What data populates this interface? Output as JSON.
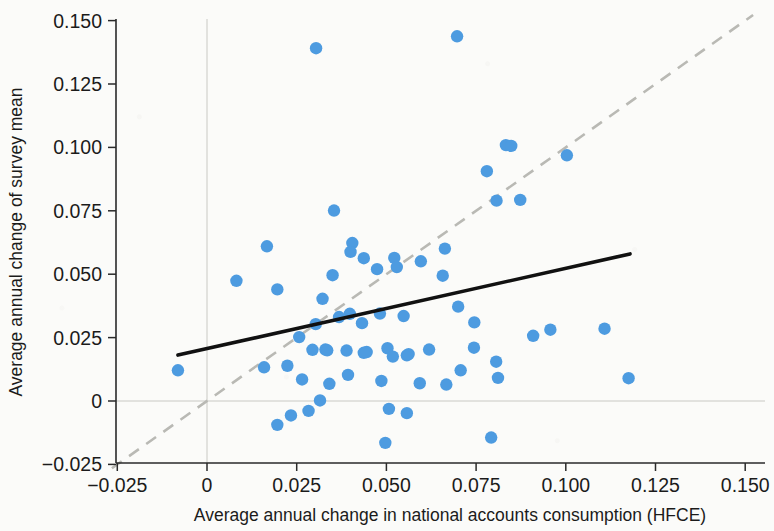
{
  "chart_data": {
    "type": "scatter",
    "title": "",
    "xlabel": "Average annual change in national accounts consumption (HFCE)",
    "ylabel": "Average annual change of survey mean",
    "xlim": [
      -0.0325,
      0.1565
    ],
    "ylim": [
      -0.0295,
      0.153
    ],
    "xticks": [
      -0.025,
      0,
      0.025,
      0.05,
      0.075,
      0.1,
      0.125,
      0.15
    ],
    "xtick_labels": [
      "−0.025",
      "0",
      "0.025",
      "0.050",
      "0.075",
      "0.100",
      "0.125",
      "0.150"
    ],
    "yticks": [
      -0.025,
      0,
      0.025,
      0.05,
      0.075,
      0.1,
      0.125,
      0.15
    ],
    "ytick_labels": [
      "−0.025",
      "0",
      "0.025",
      "0.050",
      "0.075",
      "0.100",
      "0.125",
      "0.150"
    ],
    "grid": "zero-lines-only",
    "legend": "none",
    "point_color": "#4d9be0",
    "point_radius_px": 6.2,
    "fit_line": {
      "name": "linear fit",
      "color": "#111111",
      "style": "solid",
      "x": [
        -0.0081,
        0.1179
      ],
      "y": [
        0.0181,
        0.058
      ]
    },
    "identity_line": {
      "name": "45-degree line",
      "color": "#b9b9b4",
      "style": "dashed",
      "x": [
        -0.0265,
        0.1522
      ],
      "y": [
        -0.0265,
        0.1522
      ]
    },
    "series": [
      {
        "name": "Countries",
        "points": [
          [
            0.0304,
            0.1391
          ],
          [
            0.0697,
            0.1438
          ],
          [
            0.0833,
            0.1009
          ],
          [
            0.0848,
            0.1006
          ],
          [
            0.1003,
            0.0969
          ],
          [
            0.078,
            0.0906
          ],
          [
            0.0807,
            0.079
          ],
          [
            0.0873,
            0.0793
          ],
          [
            0.0354,
            0.0751
          ],
          [
            0.0167,
            0.061
          ],
          [
            0.0405,
            0.0623
          ],
          [
            0.04,
            0.0588
          ],
          [
            0.0437,
            0.0563
          ],
          [
            0.0522,
            0.0564
          ],
          [
            0.0663,
            0.0601
          ],
          [
            0.0596,
            0.0551
          ],
          [
            0.0529,
            0.0528
          ],
          [
            0.0082,
            0.0474
          ],
          [
            0.035,
            0.0496
          ],
          [
            0.0196,
            0.044
          ],
          [
            0.0474,
            0.052
          ],
          [
            0.0657,
            0.0494
          ],
          [
            0.0322,
            0.0403
          ],
          [
            0.07,
            0.0372
          ],
          [
            0.0368,
            0.0331
          ],
          [
            0.0398,
            0.0344
          ],
          [
            0.0482,
            0.0345
          ],
          [
            0.0548,
            0.0335
          ],
          [
            0.0303,
            0.0303
          ],
          [
            0.0432,
            0.0307
          ],
          [
            0.0745,
            0.031
          ],
          [
            0.0957,
            0.0281
          ],
          [
            0.1108,
            0.0285
          ],
          [
            0.0909,
            0.0257
          ],
          [
            0.0257,
            0.0252
          ],
          [
            0.0294,
            0.0202
          ],
          [
            0.033,
            0.0203
          ],
          [
            0.0335,
            0.02
          ],
          [
            0.0389,
            0.0199
          ],
          [
            0.0437,
            0.019
          ],
          [
            0.0445,
            0.0193
          ],
          [
            0.0503,
            0.0208
          ],
          [
            0.0518,
            0.0175
          ],
          [
            0.0557,
            0.018
          ],
          [
            0.0562,
            0.0185
          ],
          [
            0.0619,
            0.0203
          ],
          [
            0.0744,
            0.021
          ],
          [
            0.0806,
            0.0155
          ],
          [
            0.0159,
            0.0133
          ],
          [
            0.0224,
            0.0139
          ],
          [
            -0.0081,
            0.0121
          ],
          [
            0.0707,
            0.0121
          ],
          [
            0.1175,
            0.009
          ],
          [
            0.0811,
            0.0091
          ],
          [
            0.0393,
            0.0103
          ],
          [
            0.0265,
            0.0085
          ],
          [
            0.0341,
            0.0068
          ],
          [
            0.0486,
            0.0079
          ],
          [
            0.0593,
            0.007
          ],
          [
            0.0667,
            0.0065
          ],
          [
            0.0315,
            0.0002
          ],
          [
            0.0507,
            -0.0031
          ],
          [
            0.0283,
            -0.0039
          ],
          [
            0.0557,
            -0.0048
          ],
          [
            0.0234,
            -0.0057
          ],
          [
            0.0196,
            -0.0094
          ],
          [
            0.0497,
            -0.0165
          ],
          [
            0.0792,
            -0.0144
          ]
        ]
      }
    ]
  },
  "axes": {
    "x_title": "Average annual change in national accounts consumption (HFCE)",
    "y_title": "Average annual change of survey mean"
  }
}
